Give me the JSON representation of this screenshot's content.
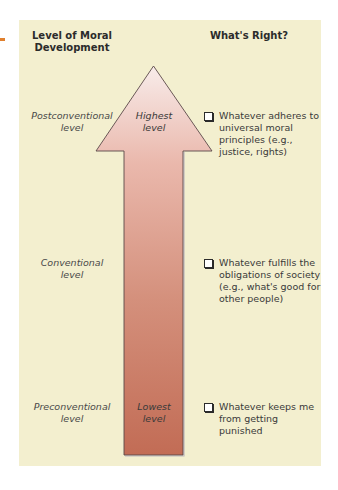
{
  "diagram": {
    "colors": {
      "panel_bg": "#f3efcf",
      "accent_dash": "#e0802e",
      "arrow_top": "#f6e6e2",
      "arrow_bottom": "#c4705a",
      "arrow_outline": "#5a4a4a"
    },
    "headers": {
      "left": "Level of Moral Development",
      "right": "What's Right?"
    },
    "arrow": {
      "direction": "up",
      "top_label_line1": "Highest",
      "top_label_line2": "level",
      "bottom_label_line1": "Lowest",
      "bottom_label_line2": "level"
    },
    "levels": [
      {
        "name_line1": "Postconventional",
        "name_line2": "level",
        "whats_right": "Whatever adheres to universal moral principles (e.g., justice, rights)"
      },
      {
        "name_line1": "Conventional",
        "name_line2": "level",
        "whats_right": "Whatever fulfills the obligations of society (e.g., what's good for other people)"
      },
      {
        "name_line1": "Preconventional",
        "name_line2": "level",
        "whats_right": "Whatever keeps me from getting punished"
      }
    ]
  }
}
